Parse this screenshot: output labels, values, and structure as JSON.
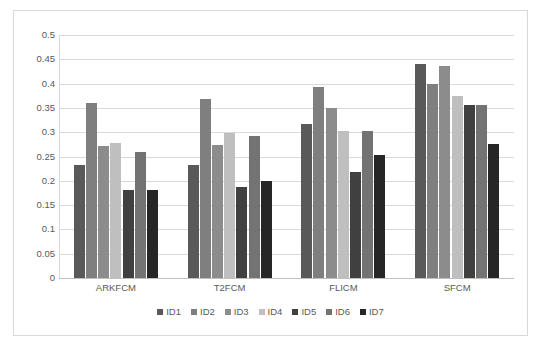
{
  "chart_data": {
    "type": "bar",
    "title": "",
    "subtitle": "",
    "xlabel": "",
    "ylabel": "",
    "categories": [
      "ARKFCM",
      "T2FCM",
      "FLICM",
      "SFCM"
    ],
    "series": [
      {
        "name": "ID1",
        "color": "#595959",
        "values": [
          0.233,
          0.232,
          0.317,
          0.44
        ]
      },
      {
        "name": "ID2",
        "color": "#7f7f7f",
        "values": [
          0.36,
          0.368,
          0.393,
          0.4
        ]
      },
      {
        "name": "ID3",
        "color": "#8c8c8c",
        "values": [
          0.272,
          0.274,
          0.35,
          0.437
        ]
      },
      {
        "name": "ID4",
        "color": "#bfbfbf",
        "values": [
          0.278,
          0.298,
          0.303,
          0.375
        ]
      },
      {
        "name": "ID5",
        "color": "#404040",
        "values": [
          0.182,
          0.187,
          0.218,
          0.355
        ]
      },
      {
        "name": "ID6",
        "color": "#737373",
        "values": [
          0.26,
          0.292,
          0.303,
          0.355
        ]
      },
      {
        "name": "ID7",
        "color": "#262626",
        "values": [
          0.182,
          0.2,
          0.253,
          0.275
        ]
      }
    ],
    "ylim": [
      0,
      0.5
    ],
    "ytick_step": 0.05,
    "ytick_labels": [
      "0.5",
      "0.45",
      "0.4",
      "0.35",
      "0.3",
      "0.25",
      "0.2",
      "0.15",
      "0.1",
      "0.05",
      "0"
    ],
    "grid": true,
    "grid_color": "#d9d9d9",
    "legend_position": "bottom",
    "plot_background": "#ffffff",
    "border_color": "#d9d9d9"
  }
}
